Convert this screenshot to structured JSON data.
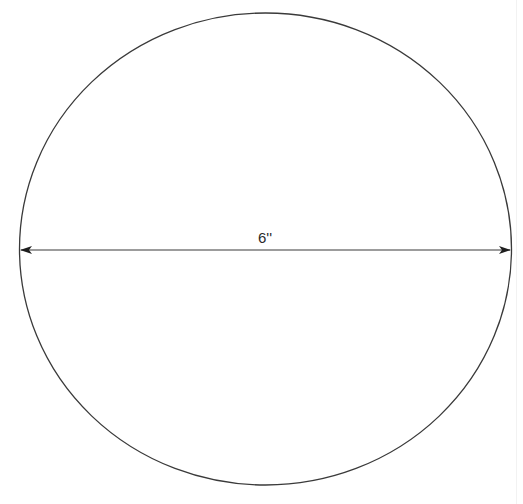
{
  "diagram": {
    "shape": "circle",
    "dimension": {
      "label": "6''",
      "type": "diameter",
      "arrows": "double-headed"
    },
    "colors": {
      "stroke": "#2a2a2a",
      "background": "#ffffff"
    }
  }
}
